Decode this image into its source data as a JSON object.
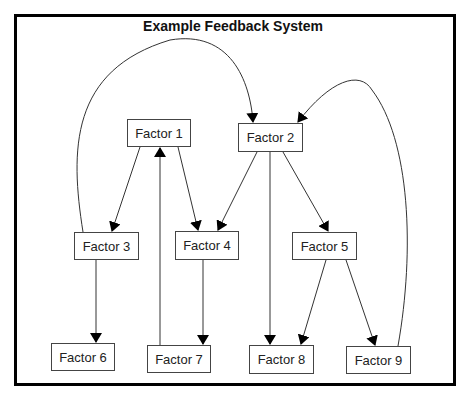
{
  "title": "Example Feedback System",
  "nodes": [
    {
      "id": "f1",
      "label": "Factor 1",
      "x": 127,
      "y": 119,
      "w": 64,
      "h": 28
    },
    {
      "id": "f2",
      "label": "Factor 2",
      "x": 238,
      "y": 123,
      "w": 65,
      "h": 29
    },
    {
      "id": "f3",
      "label": "Factor 3",
      "x": 74,
      "y": 232,
      "w": 65,
      "h": 28
    },
    {
      "id": "f4",
      "label": "Factor 4",
      "x": 175,
      "y": 231,
      "w": 64,
      "h": 29
    },
    {
      "id": "f5",
      "label": "Factor 5",
      "x": 292,
      "y": 232,
      "w": 65,
      "h": 28
    },
    {
      "id": "f6",
      "label": "Factor 6",
      "x": 51,
      "y": 343,
      "w": 64,
      "h": 28
    },
    {
      "id": "f7",
      "label": "Factor 7",
      "x": 147,
      "y": 345,
      "w": 64,
      "h": 28
    },
    {
      "id": "f8",
      "label": "Factor 8",
      "x": 249,
      "y": 345,
      "w": 65,
      "h": 29
    },
    {
      "id": "f9",
      "label": "Factor 9",
      "x": 346,
      "y": 346,
      "w": 65,
      "h": 28
    }
  ],
  "edges": [
    {
      "from": "Factor 1",
      "to": "Factor 3"
    },
    {
      "from": "Factor 1",
      "to": "Factor 4"
    },
    {
      "from": "Factor 2",
      "to": "Factor 4"
    },
    {
      "from": "Factor 2",
      "to": "Factor 8"
    },
    {
      "from": "Factor 2",
      "to": "Factor 5"
    },
    {
      "from": "Factor 3",
      "to": "Factor 6"
    },
    {
      "from": "Factor 3",
      "to": "Factor 2"
    },
    {
      "from": "Factor 4",
      "to": "Factor 7"
    },
    {
      "from": "Factor 7",
      "to": "Factor 1"
    },
    {
      "from": "Factor 5",
      "to": "Factor 8"
    },
    {
      "from": "Factor 5",
      "to": "Factor 9"
    },
    {
      "from": "Factor 9",
      "to": "Factor 2"
    }
  ]
}
